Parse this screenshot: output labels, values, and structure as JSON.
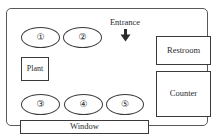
{
  "diagram": {
    "entrance": {
      "label": "Entrance",
      "arrow_icon": "down-arrow-icon",
      "direction": "down"
    },
    "tables": [
      {
        "id": "table-1",
        "label": "①",
        "number": 1,
        "shape": "ellipse"
      },
      {
        "id": "table-2",
        "label": "②",
        "number": 2,
        "shape": "ellipse"
      },
      {
        "id": "table-3",
        "label": "③",
        "number": 3,
        "shape": "ellipse"
      },
      {
        "id": "table-4",
        "label": "④",
        "number": 4,
        "shape": "ellipse"
      },
      {
        "id": "table-5",
        "label": "⑤",
        "number": 5,
        "shape": "ellipse"
      }
    ],
    "fixtures": [
      {
        "id": "plant",
        "label": "Plant",
        "shape": "rectangle"
      },
      {
        "id": "restroom",
        "label": "Restroom",
        "shape": "rectangle"
      },
      {
        "id": "counter",
        "label": "Counter",
        "shape": "rectangle"
      },
      {
        "id": "window",
        "label": "Window",
        "shape": "rectangle"
      }
    ],
    "colors": {
      "outline": "#59595c",
      "shape_stroke": "#3a3a3d",
      "text": "#2b2b2e",
      "background": "#ffffff"
    }
  }
}
